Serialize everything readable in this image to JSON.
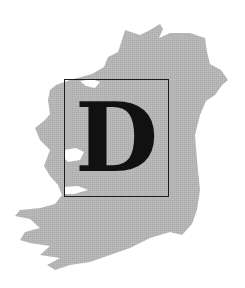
{
  "logo": {
    "letter": "D",
    "map_region": "Ireland",
    "colors": {
      "background": "#ffffff",
      "map_fill": "#b4b4b4",
      "frame": "#1a1a1a",
      "letter": "#111111"
    }
  }
}
